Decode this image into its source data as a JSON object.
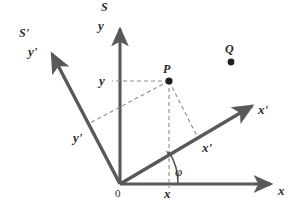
{
  "figure": {
    "type": "geometry-diagram",
    "background_color": "#ffffff",
    "axis_color": "#595959",
    "dash_color": "#8c8c8c",
    "text_color": "#2b2b2b"
  },
  "frames": {
    "unprimed_label": "S",
    "primed_label": "S'"
  },
  "axes": {
    "x_label": "x",
    "y_label": "y",
    "x_prime_label": "x'",
    "y_prime_label": "y'",
    "x_prime_inner_label": "x'",
    "y_prime_inner_label": "y'",
    "origin_label": "0"
  },
  "coordinates": {
    "x_component_label": "x",
    "y_component_label": "y"
  },
  "points": [
    {
      "name": "P",
      "label": "P"
    },
    {
      "name": "Q",
      "label": "Q"
    }
  ],
  "angle": {
    "symbol": "φ",
    "between": "x and x'"
  },
  "geometry": {
    "origin": {
      "x": 120,
      "y": 184
    },
    "x_axis_tip": {
      "x": 278,
      "y": 184
    },
    "y_axis_tip": {
      "x": 120,
      "y": 22
    },
    "x_prime_tip": {
      "x": 258,
      "y": 103
    },
    "y_prime_tip": {
      "x": 47,
      "y": 48
    },
    "point_P": {
      "x": 169,
      "y": 81
    },
    "point_Q": {
      "x": 231,
      "y": 62
    },
    "foot_on_x": {
      "x": 169,
      "y": 184
    },
    "foot_on_y": {
      "x": 120,
      "y": 81
    },
    "foot_on_x_prime": {
      "x": 196,
      "y": 135
    },
    "foot_on_y_prime": {
      "x": 92,
      "y": 122
    }
  }
}
